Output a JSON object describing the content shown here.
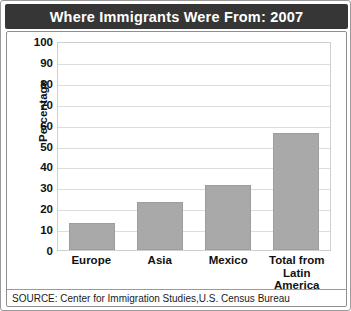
{
  "chart_data": {
    "type": "bar",
    "title": "Where Immigrants Were From: 2007",
    "xlabel": "",
    "ylabel": "Percentage",
    "categories": [
      "Europe",
      "Asia",
      "Mexico",
      "Total from Latin America"
    ],
    "values": [
      13,
      23,
      31,
      56
    ],
    "ylim": [
      0,
      100
    ],
    "ytick_step": 10,
    "yticks": [
      100,
      90,
      80,
      70,
      60,
      50,
      40,
      30,
      20,
      10,
      0
    ],
    "grid": true,
    "legend": null,
    "bar_color": "#a9a9a9",
    "title_background": "#363636",
    "title_color": "#ffffff",
    "source": "SOURCE: Center for Immigration Studies,U.S. Census Bureau"
  },
  "category_lines": [
    [
      "Europe"
    ],
    [
      "Asia"
    ],
    [
      "Mexico"
    ],
    [
      "Total from",
      "Latin",
      "America"
    ]
  ]
}
